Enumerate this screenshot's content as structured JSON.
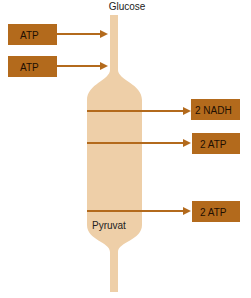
{
  "labels": {
    "top": "Glucose",
    "bottom": "Pyruvat"
  },
  "inputs": [
    {
      "label": "ATP"
    },
    {
      "label": "ATP"
    }
  ],
  "outputs": [
    {
      "label": "2 NADH"
    },
    {
      "label": "2 ATP"
    },
    {
      "label": "2 ATP"
    }
  ],
  "colors": {
    "box": "#b36a1c",
    "arrow": "#b36a1c",
    "tube": "#eecfa8",
    "text": "#1e0f02"
  }
}
